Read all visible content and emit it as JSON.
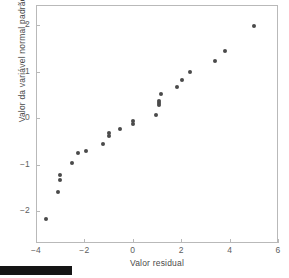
{
  "chart_data": {
    "type": "scatter",
    "title": "",
    "xlabel": "Valor residual",
    "ylabel": "Valor da variável normal padrão z",
    "ylabel_subscript": "j",
    "xlim": [
      -4,
      6
    ],
    "ylim": [
      -2.55,
      2.55
    ],
    "xticks": [
      -4,
      -2,
      0,
      2,
      4,
      6
    ],
    "xtick_labels": [
      "−4",
      "−2",
      "0",
      "2",
      "4",
      "6"
    ],
    "yticks": [
      2,
      1,
      0,
      -1,
      -2
    ],
    "ytick_labels": [
      "2",
      "1",
      "0",
      "−1",
      "−2"
    ],
    "grid": false,
    "legend": null,
    "marker_color": "#4a4a4a",
    "frame_color": "#b9b9b9",
    "points": [
      {
        "x": -3.6,
        "y": -2.18
      },
      {
        "x": -3.1,
        "y": -1.6
      },
      {
        "x": -3.02,
        "y": -1.33
      },
      {
        "x": -3.0,
        "y": -1.22
      },
      {
        "x": -2.52,
        "y": -0.97
      },
      {
        "x": -2.25,
        "y": -0.76
      },
      {
        "x": -1.95,
        "y": -0.7
      },
      {
        "x": -1.22,
        "y": -0.56
      },
      {
        "x": -1.0,
        "y": -0.39
      },
      {
        "x": -0.98,
        "y": -0.33
      },
      {
        "x": -0.52,
        "y": -0.23
      },
      {
        "x": 0.0,
        "y": -0.13
      },
      {
        "x": 0.01,
        "y": -0.07
      },
      {
        "x": 0.95,
        "y": 0.07
      },
      {
        "x": 1.08,
        "y": 0.27
      },
      {
        "x": 1.09,
        "y": 0.32
      },
      {
        "x": 1.1,
        "y": 0.37
      },
      {
        "x": 1.15,
        "y": 0.52
      },
      {
        "x": 1.82,
        "y": 0.66
      },
      {
        "x": 2.05,
        "y": 0.81
      },
      {
        "x": 2.38,
        "y": 0.98
      },
      {
        "x": 3.4,
        "y": 1.22
      },
      {
        "x": 3.82,
        "y": 1.45
      },
      {
        "x": 5.0,
        "y": 1.97
      }
    ]
  },
  "artifacts": {
    "scan_bar_label": "scan-edge-artifact"
  }
}
